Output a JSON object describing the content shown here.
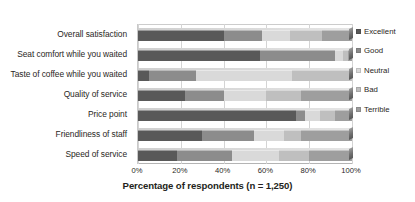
{
  "chart_data": {
    "type": "bar",
    "orientation": "horizontal",
    "stacked": true,
    "normalized_percent": true,
    "title": "",
    "xlabel": "Percentage of respondents (n = 1,250)",
    "ylabel": "",
    "xlim": [
      0,
      100
    ],
    "xticks": [
      "0%",
      "20%",
      "40%",
      "60%",
      "80%",
      "100%"
    ],
    "xtick_values": [
      0,
      20,
      40,
      60,
      80,
      100
    ],
    "grid": true,
    "grid_axis": "x",
    "legend_position": "right",
    "categories": [
      "Overall satisfaction",
      "Seat comfort while you waited",
      "Taste of coffee while you waited",
      "Quality of service",
      "Price point",
      "Friendliness of staff",
      "Speed of service"
    ],
    "series": [
      {
        "name": "Excellent",
        "color": "#595959",
        "values": [
          40,
          57,
          5,
          22,
          74,
          30,
          18
        ]
      },
      {
        "name": "Good",
        "color": "#8c8c8c",
        "values": [
          18,
          35,
          22,
          18,
          4,
          24,
          26
        ]
      },
      {
        "name": "Neutral",
        "color": "#d9d9d9",
        "values": [
          13,
          4,
          45,
          20,
          7,
          14,
          22
        ]
      },
      {
        "name": "Bad",
        "color": "#bfbfbf",
        "values": [
          15,
          2,
          28,
          16,
          7,
          8,
          14
        ]
      },
      {
        "name": "Terrible",
        "color": "#9e9e9e",
        "values": [
          14,
          2,
          0,
          24,
          8,
          24,
          20
        ]
      }
    ]
  },
  "legend": {
    "items": [
      {
        "label": "Excellent",
        "color": "#595959"
      },
      {
        "label": "Good",
        "color": "#8c8c8c"
      },
      {
        "label": "Neutral",
        "color": "#d9d9d9"
      },
      {
        "label": "Bad",
        "color": "#bfbfbf"
      },
      {
        "label": "Terrible",
        "color": "#9e9e9e"
      }
    ]
  },
  "axis": {
    "x_title": "Percentage of respondents (n = 1,250)",
    "ticks": [
      "0%",
      "20%",
      "40%",
      "60%",
      "80%",
      "100%"
    ]
  },
  "colors": {
    "plot_background": "#ffffff",
    "gridline": "#d4d4d4",
    "text": "#2a2724"
  }
}
